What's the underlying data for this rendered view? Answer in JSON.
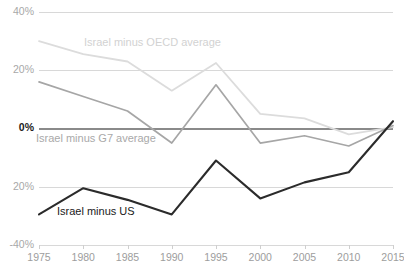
{
  "chart_data": {
    "type": "line",
    "title": "",
    "subtitle": "",
    "xlabel": "",
    "ylabel": "",
    "x": [
      1975,
      1980,
      1985,
      1990,
      1995,
      2000,
      2005,
      2010,
      2015
    ],
    "categories": [
      "1975",
      "1980",
      "1985",
      "1990",
      "1995",
      "2000",
      "2005",
      "2010",
      "2015"
    ],
    "xlim": [
      1975,
      2015
    ],
    "ylim": [
      -40,
      40
    ],
    "yticks": [
      40,
      20,
      0,
      -20,
      -40
    ],
    "ytick_labels": [
      "40%",
      "20%",
      "0%",
      "20%",
      "-40%"
    ],
    "grid": true,
    "legend_position": "inline-annotations",
    "series": [
      {
        "name": "Israel minus OECD average",
        "color": "#dcdcdc",
        "values": [
          30.0,
          25.5,
          23.0,
          13.0,
          22.5,
          5.0,
          3.5,
          -2.0,
          0.5
        ]
      },
      {
        "name": "Israel minus G7 average",
        "color": "#a6a6a6",
        "values": [
          16.0,
          11.0,
          6.0,
          -5.0,
          15.0,
          -5.0,
          -2.5,
          -6.0,
          1.0
        ]
      },
      {
        "name": "Israel minus US",
        "color": "#2b2b2b",
        "values": [
          -29.5,
          -20.5,
          -24.5,
          -29.5,
          -11.0,
          -24.0,
          -18.5,
          -15.0,
          2.5
        ]
      }
    ],
    "annotations": [
      {
        "text": "Israel minus OECD average",
        "series": "Israel minus OECD average",
        "color": "#d2d2d2",
        "x_px": 84,
        "y_px": 43
      },
      {
        "text": "Israel minus G7 average",
        "series": "Israel minus G7 average",
        "color": "#a9a9a9",
        "x_px": 36,
        "y_px": 139
      },
      {
        "text": "Israel minus US",
        "series": "Israel minus US",
        "color": "#1a1a1a",
        "x_px": 57,
        "y_px": 212
      }
    ]
  },
  "axes": {
    "y_labels": [
      {
        "text": "40%",
        "value": 40
      },
      {
        "text": "20%",
        "value": 20
      },
      {
        "text": "0%",
        "value": 0
      },
      {
        "text": "20%",
        "value": -20
      },
      {
        "text": "-40%",
        "value": -40
      }
    ],
    "x_labels": [
      {
        "text": "1975"
      },
      {
        "text": "1980"
      },
      {
        "text": "1985"
      },
      {
        "text": "1990"
      },
      {
        "text": "1995"
      },
      {
        "text": "2000"
      },
      {
        "text": "2005"
      },
      {
        "text": "2010"
      },
      {
        "text": "2015"
      }
    ]
  },
  "colors": {
    "background": "#ffffff",
    "gridline": "#d8d8d8",
    "zero_line": "#8a8a8a",
    "oecd": "#dcdcdc",
    "g7": "#a6a6a6",
    "us": "#2b2b2b",
    "tick_text": "#a0a0a0",
    "zero_tick_text": "#1a1a1a"
  }
}
